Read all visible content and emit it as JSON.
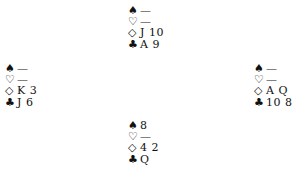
{
  "suit_symbols": {
    "spades": "♠",
    "hearts": "♡",
    "diamonds": "◇",
    "clubs": "♣"
  },
  "hands": {
    "north": {
      "spades": "—",
      "hearts": "—",
      "diamonds": "J 10",
      "clubs": "A 9"
    },
    "west": {
      "spades": "—",
      "hearts": "—",
      "diamonds": "K 3",
      "clubs": "J 6"
    },
    "east": {
      "spades": "—",
      "hearts": "—",
      "diamonds": "A Q",
      "clubs": "10 8"
    },
    "south": {
      "spades": "8",
      "hearts": "—",
      "diamonds": "4 2",
      "clubs": "Q"
    }
  }
}
